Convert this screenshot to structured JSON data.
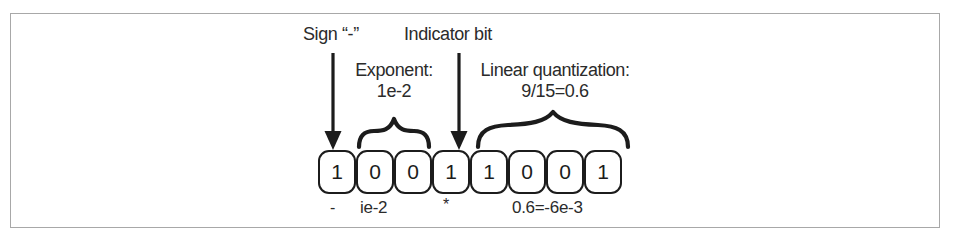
{
  "figure": {
    "type": "bit-field-diagram",
    "border_color": "#a8a8a8",
    "ink_color": "#1c1c1c",
    "text_color": "#2b2b2b",
    "top_labels": {
      "sign": "Sign “-”",
      "indicator": "Indicator bit"
    },
    "field_labels": {
      "exponent_line1": "Exponent:",
      "exponent_line2": "1e-2",
      "quantization_line1": "Linear quantization:",
      "quantization_line2": "9/15=0.6"
    },
    "bits": [
      {
        "value": "1"
      },
      {
        "value": "0"
      },
      {
        "value": "0"
      },
      {
        "value": "1"
      },
      {
        "value": "1"
      },
      {
        "value": "0"
      },
      {
        "value": "0"
      },
      {
        "value": "1"
      }
    ],
    "bottom_notes": {
      "sign": "-",
      "exponent": "ie-2",
      "indicator": "*",
      "quantization": "0.6=-6e-3"
    }
  }
}
